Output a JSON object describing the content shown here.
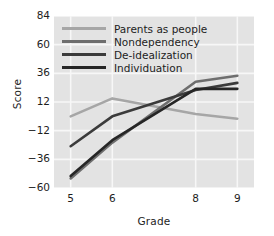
{
  "chart_data": {
    "type": "line",
    "title": "",
    "xlabel": "Grade",
    "ylabel": "Score",
    "categories": [
      "5",
      "6",
      "8",
      "9"
    ],
    "x": [
      5,
      6,
      8,
      9
    ],
    "xlim": [
      4.6,
      9.4
    ],
    "ylim": [
      -60,
      84
    ],
    "yticks": [
      84,
      60,
      36,
      12,
      -12,
      -36,
      -60
    ],
    "ytick_labels": [
      "84",
      "60",
      "36",
      "12",
      "−12",
      "−36",
      "−60"
    ],
    "xticks": [
      5,
      6,
      8,
      9
    ],
    "xtick_labels": [
      "5",
      "6",
      "8",
      "9"
    ],
    "grid": true,
    "legend_position": "upper-left-inside",
    "plot_background": "#e3e3e3",
    "grid_color": "#f7f7f7",
    "series": [
      {
        "name": "Parents as people",
        "color": "#a6a6a6",
        "values": [
          0,
          15,
          2,
          -2
        ]
      },
      {
        "name": "Nondependency",
        "color": "#6e6e6e",
        "values": [
          -52,
          -22,
          29,
          34
        ]
      },
      {
        "name": "De-idealization",
        "color": "#3b3b3b",
        "values": [
          -25,
          0,
          22,
          28
        ]
      },
      {
        "name": "Individuation",
        "color": "#262626",
        "values": [
          -50,
          -20,
          23,
          23
        ]
      }
    ]
  },
  "axes": {
    "y_title": "Score",
    "x_title": "Grade"
  }
}
